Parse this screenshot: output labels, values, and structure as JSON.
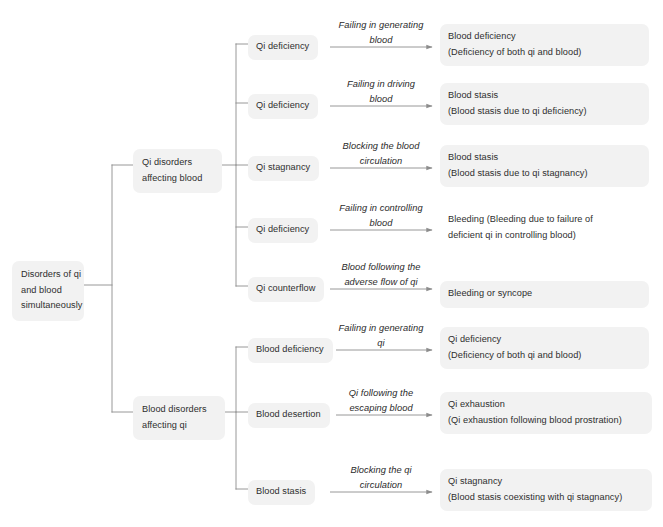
{
  "diagram": {
    "title": "Disorders of qi and blood simultaneously",
    "style": {
      "node_fill": "#f2f2f2",
      "line_color": "#8c8c8c",
      "text_color": "#2e2e2e",
      "background": "#ffffff"
    },
    "root": {
      "lines": [
        "Disorders of qi",
        "and blood",
        "simultaneously"
      ]
    },
    "branches": [
      {
        "id": "qi-disorders-affecting-blood",
        "lines": [
          "Qi disorders",
          "affecting blood"
        ],
        "rows": [
          {
            "cause": "Qi deficiency",
            "edge_label": [
              "Failing in generating",
              "blood"
            ],
            "result": [
              "Blood deficiency",
              "(Deficiency of both qi and blood)"
            ]
          },
          {
            "cause": "Qi deficiency",
            "edge_label": [
              "Failing in driving",
              "blood"
            ],
            "result": [
              "Blood stasis",
              "(Blood stasis due to qi deficiency)"
            ]
          },
          {
            "cause": "Qi stagnancy",
            "edge_label": [
              "Blocking the blood",
              "circulation"
            ],
            "result": [
              "Blood stasis",
              "(Blood stasis due to qi stagnancy)"
            ]
          },
          {
            "cause": "Qi deficiency",
            "edge_label": [
              "Failing in controlling",
              "blood"
            ],
            "result": [
              "Bleeding (Bleeding due to failure of",
              "deficient qi in controlling blood)"
            ]
          },
          {
            "cause": "Qi counterflow",
            "edge_label": [
              "Blood following the",
              "adverse flow of qi"
            ],
            "result": [
              "Bleeding or syncope"
            ]
          }
        ]
      },
      {
        "id": "blood-disorders-affecting-qi",
        "lines": [
          "Blood disorders",
          "affecting qi"
        ],
        "rows": [
          {
            "cause": "Blood deficiency",
            "edge_label": [
              "Failing in generating",
              "qi"
            ],
            "result": [
              "Qi deficiency",
              "(Deficiency of both qi and blood)"
            ]
          },
          {
            "cause": "Blood desertion",
            "edge_label": [
              "Qi following the",
              "escaping blood"
            ],
            "result": [
              "Qi exhaustion",
              "(Qi exhaustion following blood prostration)"
            ]
          },
          {
            "cause": "Blood stasis",
            "edge_label": [
              "Blocking the qi",
              "circulation"
            ],
            "result": [
              "Qi stagnancy",
              "(Blood stasis coexisting with qi stagnancy)"
            ]
          }
        ]
      }
    ]
  }
}
